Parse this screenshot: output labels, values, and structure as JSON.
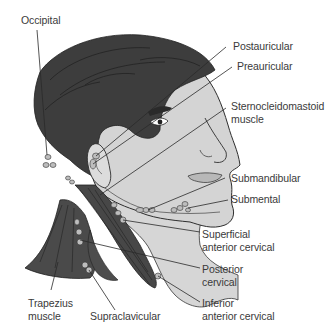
{
  "diagram": {
    "colors": {
      "hair": "#3b3b3b",
      "skin": "#d4d4d4",
      "muscle": "#4a4a4a",
      "node": "#bdbdbd",
      "leader_line": "#2a2a2a",
      "text": "#3a3a3a"
    },
    "labels": [
      {
        "id": "occipital",
        "line1": "Occipital",
        "line2": ""
      },
      {
        "id": "postauricular",
        "line1": "Postauricular",
        "line2": ""
      },
      {
        "id": "preauricular",
        "line1": "Preauricular",
        "line2": ""
      },
      {
        "id": "sternocleidomastoid",
        "line1": "Sternocleidomastoid",
        "line2": "muscle"
      },
      {
        "id": "submandibular",
        "line1": "Submandibular",
        "line2": ""
      },
      {
        "id": "submental",
        "line1": "Submental",
        "line2": ""
      },
      {
        "id": "superficial-anterior-cervical",
        "line1": "Superficial",
        "line2": "anterior cervical"
      },
      {
        "id": "posterior-cervical",
        "line1": "Posterior",
        "line2": "cervical"
      },
      {
        "id": "inferior-anterior-cervical",
        "line1": "Inferior",
        "line2": "anterior cervical"
      },
      {
        "id": "trapezius",
        "line1": "Trapezius",
        "line2": "muscle"
      },
      {
        "id": "supraclavicular",
        "line1": "Supraclavicular",
        "line2": ""
      }
    ]
  }
}
